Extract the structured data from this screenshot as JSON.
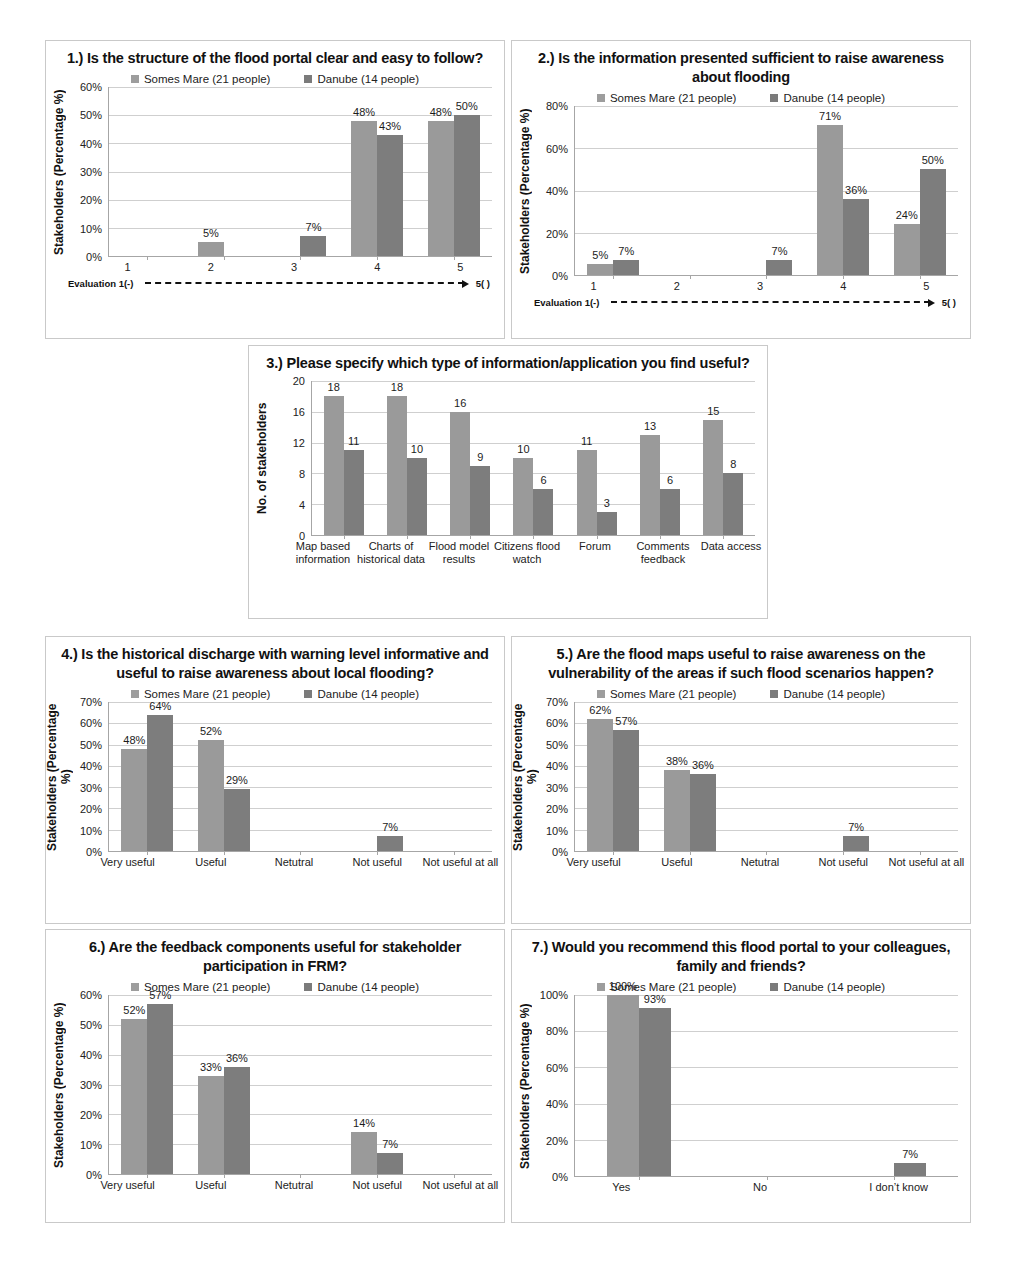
{
  "figure": {
    "legend": {
      "series_a": "Somes Mare (21 people)",
      "series_b": "Danube (14 people)",
      "swatch_a_color": "#9a9a9a",
      "swatch_b_color": "#7d7d7d"
    },
    "eval_axis": {
      "left": "Evaluation 1(-)",
      "right": "5( )"
    }
  },
  "chart_data": [
    {
      "id": "q1",
      "type": "bar",
      "title": "1.) Is the structure of the flood portal clear and easy to follow?",
      "ylabel": "Stakeholders (Percentage %)",
      "xlabel": "Evaluation 1(-)  →  5( )",
      "categories": [
        "1",
        "2",
        "3",
        "4",
        "5"
      ],
      "ylim": [
        0,
        60
      ],
      "yticks": [
        "0%",
        "10%",
        "20%",
        "30%",
        "40%",
        "50%",
        "60%"
      ],
      "grid": true,
      "legend_position": "top-center",
      "series": [
        {
          "name": "Somes Mare (21 people)",
          "values": [
            0,
            5,
            0,
            48,
            48
          ],
          "labels": [
            "",
            "5%",
            "",
            "48%",
            "48%"
          ]
        },
        {
          "name": "Danube (14 people)",
          "values": [
            0,
            0,
            7,
            43,
            50
          ],
          "labels": [
            "",
            "",
            "7%",
            "43%",
            "50%"
          ]
        }
      ]
    },
    {
      "id": "q2",
      "type": "bar",
      "title": "2.) Is the information presented sufficient to raise awareness about flooding",
      "ylabel": "Stakeholders (Percentage %)",
      "xlabel": "Evaluation 1(-)  →  5( )",
      "categories": [
        "1",
        "2",
        "3",
        "4",
        "5"
      ],
      "ylim": [
        0,
        80
      ],
      "yticks": [
        "0%",
        "20%",
        "40%",
        "60%",
        "80%"
      ],
      "grid": true,
      "legend_position": "top-center",
      "series": [
        {
          "name": "Somes Mare (21 people)",
          "values": [
            5,
            0,
            0,
            71,
            24
          ],
          "labels": [
            "5%",
            "",
            "",
            "71%",
            "24%"
          ]
        },
        {
          "name": "Danube (14 people)",
          "values": [
            7,
            0,
            7,
            36,
            50
          ],
          "labels": [
            "7%",
            "",
            "7%",
            "36%",
            "50%"
          ]
        }
      ]
    },
    {
      "id": "q3",
      "type": "bar",
      "title": "3.) Please specify which type of information/application you find useful?",
      "ylabel": "No. of stakeholders",
      "xlabel": "",
      "categories": [
        "Map based information",
        "Charts of historical data",
        "Flood model results",
        "Citizens flood watch",
        "Forum",
        "Comments feedback",
        "Data access"
      ],
      "ylim": [
        0,
        20
      ],
      "yticks": [
        "0",
        "4",
        "8",
        "12",
        "16",
        "20"
      ],
      "grid": true,
      "legend_position": "none",
      "series": [
        {
          "name": "Somes Mare (21 people)",
          "values": [
            18,
            18,
            16,
            10,
            11,
            13,
            15
          ],
          "labels": [
            "18",
            "18",
            "16",
            "10",
            "11",
            "13",
            "15"
          ]
        },
        {
          "name": "Danube (14 people)",
          "values": [
            11,
            10,
            9,
            6,
            3,
            6,
            8
          ],
          "labels": [
            "11",
            "10",
            "9",
            "6",
            "3",
            "6",
            "8"
          ]
        }
      ]
    },
    {
      "id": "q4",
      "type": "bar",
      "title": "4.) Is the historical discharge with warning level informative and useful to raise awareness about local flooding?",
      "ylabel": "Stakeholders (Percentage %)",
      "xlabel": "",
      "categories": [
        "Very useful",
        "Useful",
        "Netutral",
        "Not useful",
        "Not useful at all"
      ],
      "ylim": [
        0,
        70
      ],
      "yticks": [
        "0%",
        "10%",
        "20%",
        "30%",
        "40%",
        "50%",
        "60%",
        "70%"
      ],
      "grid": true,
      "legend_position": "top-center",
      "series": [
        {
          "name": "Somes Mare (21 people)",
          "values": [
            48,
            52,
            0,
            0,
            0
          ],
          "labels": [
            "48%",
            "52%",
            "",
            "",
            ""
          ]
        },
        {
          "name": "Danube (14 people)",
          "values": [
            64,
            29,
            0,
            7,
            0
          ],
          "labels": [
            "64%",
            "29%",
            "",
            "7%",
            ""
          ]
        }
      ]
    },
    {
      "id": "q5",
      "type": "bar",
      "title": "5.) Are the flood maps useful to raise awareness on the vulnerability of the areas if such flood scenarios happen?",
      "ylabel": "Stakeholders (Percentage %)",
      "xlabel": "",
      "categories": [
        "Very useful",
        "Useful",
        "Netutral",
        "Not useful",
        "Not useful at all"
      ],
      "ylim": [
        0,
        70
      ],
      "yticks": [
        "0%",
        "10%",
        "20%",
        "30%",
        "40%",
        "50%",
        "60%",
        "70%"
      ],
      "grid": true,
      "legend_position": "top-center",
      "series": [
        {
          "name": "Somes Mare (21 people)",
          "values": [
            62,
            38,
            0,
            0,
            0
          ],
          "labels": [
            "62%",
            "38%",
            "",
            "",
            ""
          ]
        },
        {
          "name": "Danube (14 people)",
          "values": [
            57,
            36,
            0,
            7,
            0
          ],
          "labels": [
            "57%",
            "36%",
            "",
            "7%",
            ""
          ]
        }
      ]
    },
    {
      "id": "q6",
      "type": "bar",
      "title": "6.) Are the feedback components useful   for stakeholder  participation in FRM?",
      "ylabel": "Stakeholders (Percentage %)",
      "xlabel": "",
      "categories": [
        "Very useful",
        "Useful",
        "Netutral",
        "Not useful",
        "Not useful at all"
      ],
      "ylim": [
        0,
        60
      ],
      "yticks": [
        "0%",
        "10%",
        "20%",
        "30%",
        "40%",
        "50%",
        "60%"
      ],
      "grid": true,
      "legend_position": "top-center",
      "series": [
        {
          "name": "Somes Mare (21 people)",
          "values": [
            52,
            33,
            0,
            14,
            0
          ],
          "labels": [
            "52%",
            "33%",
            "",
            "14%",
            ""
          ]
        },
        {
          "name": "Danube (14 people)",
          "values": [
            57,
            36,
            0,
            7,
            0
          ],
          "labels": [
            "57%",
            "36%",
            "",
            "7%",
            ""
          ]
        }
      ]
    },
    {
      "id": "q7",
      "type": "bar",
      "title": "7.) Would you recommend this flood portal to your colleagues, family and friends?",
      "ylabel": "Stakeholders (Percentage %)",
      "xlabel": "",
      "categories": [
        "Yes",
        "No",
        "I don’t know"
      ],
      "ylim": [
        0,
        100
      ],
      "yticks": [
        "0%",
        "20%",
        "40%",
        "60%",
        "80%",
        "100%"
      ],
      "grid": true,
      "legend_position": "top-center",
      "series": [
        {
          "name": "Somes Mare (21 people)",
          "values": [
            100,
            0,
            0
          ],
          "labels": [
            "100%",
            "",
            ""
          ]
        },
        {
          "name": "Danube (14 people)",
          "values": [
            93,
            0,
            7
          ],
          "labels": [
            "93%",
            "",
            "7%"
          ]
        }
      ]
    }
  ]
}
